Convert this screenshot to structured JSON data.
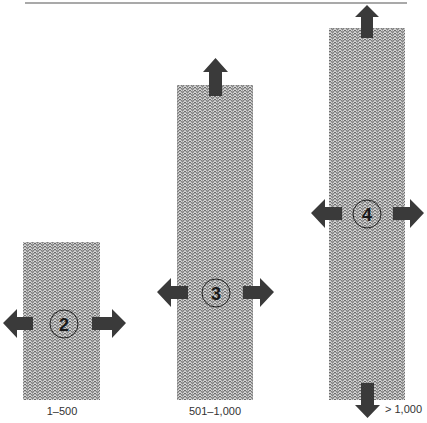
{
  "diagram": {
    "colors": {
      "arrow": "#3a3a3a",
      "texture_dark": "#555555",
      "texture_light": "#bdbdbd",
      "rule": "#555555",
      "circle_stroke": "#222222"
    },
    "columns": [
      {
        "id": "col-2",
        "number": "2",
        "label": "1–500",
        "arrows": [
          "left",
          "right"
        ]
      },
      {
        "id": "col-3",
        "number": "3",
        "label": "501–1,000",
        "arrows": [
          "left",
          "right",
          "up"
        ]
      },
      {
        "id": "col-4",
        "number": "4",
        "label": "> 1,000",
        "arrows": [
          "left",
          "right",
          "up",
          "down"
        ]
      }
    ]
  }
}
